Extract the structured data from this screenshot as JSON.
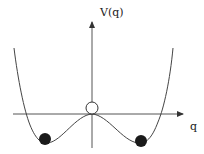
{
  "diagram": {
    "type": "double-well potential",
    "y_axis_label": "V(q)",
    "x_axis_label": "q",
    "markers": {
      "top_of_barrier": "open circle (unstable)",
      "left_minimum": "filled circle",
      "right_minimum": "filled circle"
    },
    "colors": {
      "stroke": "#333333",
      "fill_ball": "#1a1a1a",
      "background": "#ffffff"
    }
  }
}
